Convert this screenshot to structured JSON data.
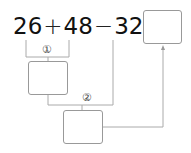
{
  "expression": {
    "operand1": "26",
    "op1": "+",
    "operand2": "48",
    "op2": "−",
    "operand3": "32",
    "equals": "="
  },
  "steps": [
    {
      "marker": "①",
      "result_box": ""
    },
    {
      "marker": "②",
      "result_box": ""
    }
  ],
  "final_answer_box": "",
  "colors": {
    "line": "#aaaaaa",
    "box_border": "#999999",
    "text": "#111111"
  }
}
